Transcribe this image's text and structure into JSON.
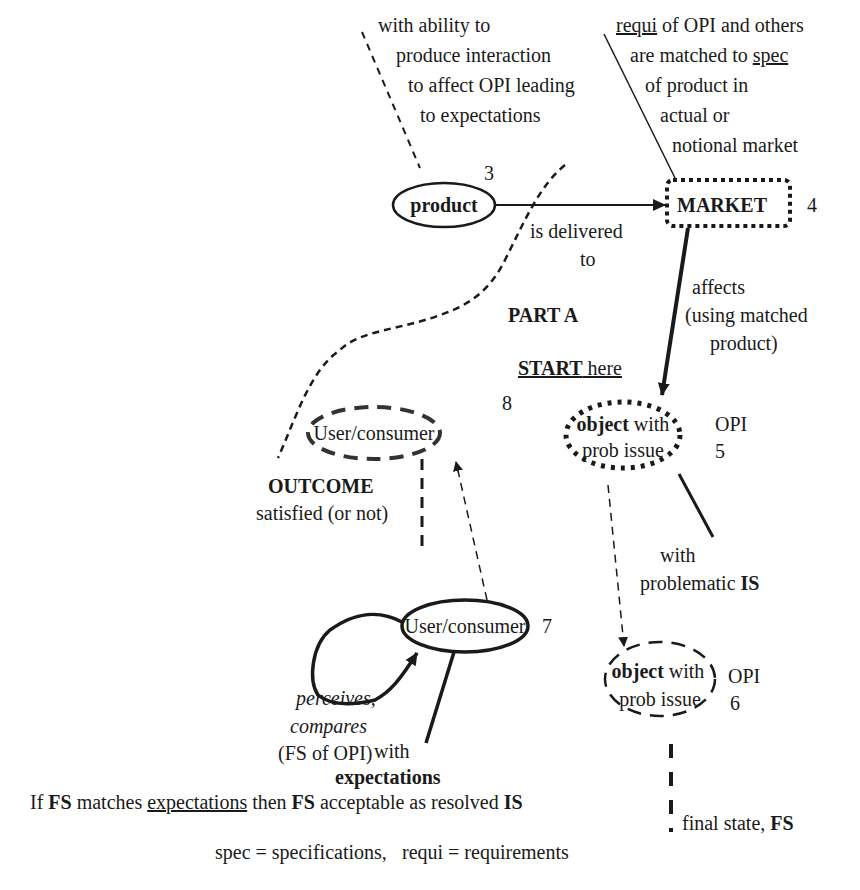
{
  "annotations": {
    "product_ability": [
      "with ability to",
      "produce interaction",
      "to affect OPI leading",
      "to expectations"
    ],
    "market_match": {
      "line1": {
        "u": "requi",
        "rest": " of OPI and others"
      },
      "line2": {
        "pre": "are matched to ",
        "u": "spec"
      },
      "line3": "of product in",
      "line4": "actual or",
      "line5": "notional market"
    },
    "is_delivered": [
      "is delivered",
      "to"
    ],
    "affects": [
      "affects",
      "(using matched",
      "product)"
    ],
    "part_a": "PART A",
    "start_here": {
      "u": "START",
      "rest": " here"
    },
    "outcome": {
      "title": "OUTCOME",
      "sub": "satisfied (or not)"
    },
    "with_problematic": {
      "line1": "with",
      "pre": "problematic ",
      "b": "IS"
    },
    "perceives": [
      "perceives,",
      "compares"
    ],
    "fs_of_opi": "(FS of OPI)",
    "with_expectations": {
      "line1": "with",
      "b": "expectations"
    },
    "final_state": {
      "pre": "final state, ",
      "b": "FS"
    },
    "rule": {
      "p1": "If ",
      "b1": "FS",
      "p2": " matches ",
      "u": "expectations",
      "p3": " then ",
      "b2": "FS",
      "p4": " acceptable as resolved ",
      "b3": "IS"
    },
    "legend": {
      "spec": "spec =  specifications,",
      "requi": "requi =  requirements"
    }
  },
  "nodes": {
    "product": {
      "label": "product",
      "number": "3"
    },
    "market": {
      "label": "MARKET",
      "number": "4"
    },
    "object5": {
      "bold": "object",
      "rest": " with",
      "line2": "prob issue",
      "tag": "OPI",
      "number": "5"
    },
    "object6": {
      "bold": "object",
      "rest": " with",
      "line2": "prob issue",
      "tag": "OPI",
      "number": "6"
    },
    "user7": {
      "label": "User/consumer",
      "number": "7"
    },
    "user8": {
      "label": "User/consumer",
      "number": "8"
    }
  }
}
